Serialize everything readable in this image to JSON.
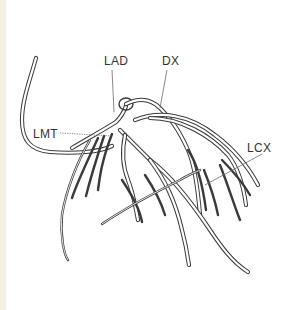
{
  "diagram": {
    "labels": {
      "lad": "LAD",
      "dx": "DX",
      "lmt": "LMT",
      "lcx": "LCX"
    },
    "colors": {
      "line": "#3a3a3a",
      "background": "#ffffff",
      "edge_strip": "#f4efe0"
    }
  }
}
